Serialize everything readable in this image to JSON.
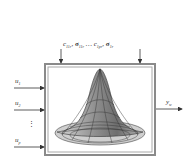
{
  "diagram": {
    "type": "rbf-neuron-block",
    "parameters_label": {
      "c1": "c",
      "c1_sub": "11r",
      "s1": "σ",
      "s1_sub": "11r",
      "ellipsis": "…",
      "c2": "c",
      "c2_sub": "1pr",
      "s2": "σ",
      "s2_sub": "1r"
    },
    "inputs": [
      {
        "name": "u",
        "sub": "1"
      },
      {
        "name": "u",
        "sub": "2"
      },
      {
        "name": "u",
        "sub": "p"
      }
    ],
    "input_ellipsis": "⋮",
    "output": {
      "name": "y",
      "sub": "w"
    },
    "colors": {
      "frame": "#8a8a8a",
      "arrow": "#333333",
      "surface_dark": "#555555",
      "surface_light": "#cfcfcf"
    }
  }
}
